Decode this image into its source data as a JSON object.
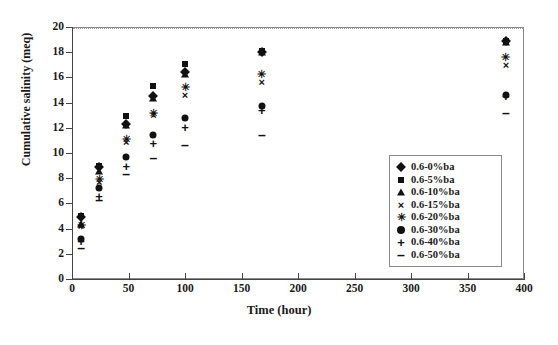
{
  "chart_data": {
    "type": "scatter",
    "title": "",
    "xlabel": "Time (hour)",
    "ylabel": "Cumulative salinity (meq)",
    "xlim": [
      0,
      400
    ],
    "ylim": [
      0,
      20
    ],
    "xticks": [
      0,
      50,
      100,
      150,
      200,
      250,
      300,
      350,
      400
    ],
    "yticks": [
      0,
      2,
      4,
      6,
      8,
      10,
      12,
      14,
      16,
      18,
      20
    ],
    "grid": "top-border-dotted-only",
    "legend_position": "inside-right-lower",
    "x": [
      8,
      24,
      48,
      72,
      100,
      168,
      384
    ],
    "series": [
      {
        "name": "0.6-0%ba",
        "marker": "diamond",
        "values": [
          4.9,
          8.9,
          12.3,
          14.5,
          16.4,
          18.0,
          18.9
        ]
      },
      {
        "name": "0.6-5%ba",
        "marker": "square",
        "values": [
          5.0,
          9.0,
          12.9,
          15.3,
          17.1,
          18.1,
          18.9
        ]
      },
      {
        "name": "0.6-10%ba",
        "marker": "triangle",
        "values": [
          4.4,
          8.6,
          12.2,
          14.4,
          16.3,
          18.0,
          18.8
        ]
      },
      {
        "name": "0.6-15%ba",
        "marker": "cross",
        "values": [
          4.2,
          7.7,
          10.9,
          13.0,
          14.6,
          15.6,
          17.0
        ]
      },
      {
        "name": "0.6-20%ba",
        "marker": "star",
        "values": [
          4.3,
          7.9,
          11.1,
          13.2,
          15.2,
          16.3,
          17.6
        ]
      },
      {
        "name": "0.6-30%ba",
        "marker": "circle",
        "values": [
          3.2,
          7.2,
          9.7,
          11.4,
          12.8,
          13.7,
          14.6
        ]
      },
      {
        "name": "0.6-40%ba",
        "marker": "plus",
        "values": [
          3.0,
          6.6,
          9.0,
          10.8,
          12.1,
          13.4,
          14.5
        ]
      },
      {
        "name": "0.6-50%ba",
        "marker": "dash",
        "values": [
          2.5,
          6.3,
          8.3,
          9.6,
          10.6,
          11.4,
          13.2
        ]
      }
    ]
  }
}
